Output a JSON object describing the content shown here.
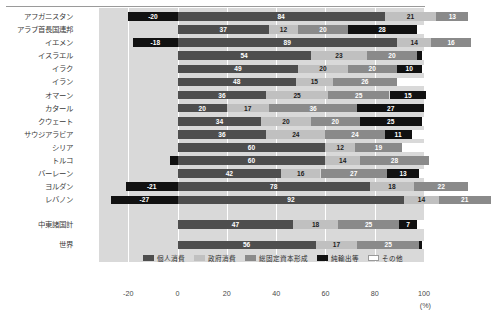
{
  "chart_data": {
    "type": "bar",
    "orientation": "horizontal",
    "stacked": true,
    "title": "",
    "xlabel": "(%)",
    "ylabel": "",
    "xlim": [
      -40,
      100
    ],
    "xticks": [
      -20,
      0,
      20,
      40,
      60,
      80,
      100
    ],
    "xtick_labels": [
      "-20",
      "0",
      "20",
      "40",
      "60",
      "80",
      "100"
    ],
    "grid": true,
    "legend_position": "bottom",
    "categories": [
      "アフガニスタン",
      "アラブ首長国連邦",
      "イエメン",
      "イスラエル",
      "イラク",
      "イラン",
      "オマーン",
      "カタール",
      "クウェート",
      "サウジアラビア",
      "シリア",
      "トルコ",
      "バーレーン",
      "ヨルダン",
      "レバノン",
      "中東諸国計",
      "世界"
    ],
    "series": [
      {
        "name": "個人消費",
        "color": "#4e4e4e",
        "values": [
          84,
          37,
          89,
          54,
          49,
          48,
          36,
          20,
          34,
          36,
          60,
          60,
          42,
          78,
          92,
          47,
          56
        ]
      },
      {
        "name": "政府消費",
        "color": "#c0c0c0",
        "values": [
          21,
          12,
          14,
          23,
          20,
          15,
          25,
          17,
          20,
          24,
          12,
          14,
          16,
          18,
          14,
          18,
          17
        ]
      },
      {
        "name": "総固定資本形成",
        "color": "#8a8a8a",
        "values": [
          13,
          20,
          16,
          20,
          20,
          26,
          25,
          36,
          20,
          24,
          19,
          28,
          27,
          22,
          21,
          25,
          25
        ]
      },
      {
        "name": "純輸出等",
        "color": "#111111",
        "values": [
          -20,
          28,
          -18,
          2,
          10,
          0,
          15,
          27,
          25,
          11,
          0,
          -3,
          13,
          0,
          -27,
          7,
          1
        ]
      },
      {
        "name": "その他",
        "color": "#ffffff",
        "values": [
          2,
          3,
          0,
          1,
          1,
          11,
          0,
          0,
          1,
          5,
          9,
          1,
          2,
          5,
          0,
          3,
          1
        ]
      }
    ],
    "rows": [
      {
        "label": "アフガニスタン",
        "net": -20,
        "net_label": "-20",
        "personal": 84,
        "gov": 21,
        "capital": 13,
        "other": 4
      },
      {
        "label": "アラブ首長国連邦",
        "net": 28,
        "net_label": "28",
        "personal": 37,
        "gov": 12,
        "capital": 20,
        "other": 3
      },
      {
        "label": "イエメン",
        "net": -18,
        "net_label": "-18",
        "personal": 89,
        "gov": 14,
        "capital": 16,
        "other": 0
      },
      {
        "label": "イスラエル",
        "net": 2,
        "net_label": "2",
        "personal": 54,
        "gov": 23,
        "capital": 20,
        "other": 1
      },
      {
        "label": "イラク",
        "net": 10,
        "net_label": "10",
        "personal": 49,
        "gov": 20,
        "capital": 20,
        "other": 1
      },
      {
        "label": "イラン",
        "net": 0,
        "net_label": "0",
        "personal": 48,
        "gov": 15,
        "capital": 26,
        "other": 11
      },
      {
        "label": "オマーン",
        "net": 15,
        "net_label": "15",
        "personal": 36,
        "gov": 25,
        "capital": 25,
        "other": 0
      },
      {
        "label": "カタール",
        "net": 27,
        "net_label": "27",
        "personal": 20,
        "gov": 17,
        "capital": 36,
        "other": 0
      },
      {
        "label": "クウェート",
        "net": 25,
        "net_label": "25",
        "personal": 34,
        "gov": 20,
        "capital": 20,
        "other": 1
      },
      {
        "label": "サウジアラビア",
        "net": 11,
        "net_label": "11",
        "personal": 36,
        "gov": 24,
        "capital": 24,
        "other": 5
      },
      {
        "label": "シリア",
        "net": 0,
        "net_label": "0",
        "personal": 60,
        "gov": 12,
        "capital": 19,
        "other": 9
      },
      {
        "label": "トルコ",
        "net": -3,
        "net_label": "-3",
        "personal": 60,
        "gov": 14,
        "capital": 28,
        "other": 1
      },
      {
        "label": "バーレーン",
        "net": 13,
        "net_label": "13",
        "personal": 42,
        "gov": 16,
        "capital": 27,
        "other": 2
      },
      {
        "label": "ヨルダン",
        "net": -21,
        "net_label": "-21",
        "personal": 78,
        "gov": 18,
        "capital": 22,
        "other": 5
      },
      {
        "label": "レバノン",
        "net": -27,
        "net_label": "-27",
        "personal": 92,
        "gov": 14,
        "capital": 21,
        "other": 0
      },
      {
        "label": "中東諸国計",
        "net": 7,
        "net_label": "7",
        "personal": 47,
        "gov": 18,
        "capital": 25,
        "other": 3
      },
      {
        "label": "世界",
        "net": 1,
        "net_label": "1",
        "personal": 56,
        "gov": 17,
        "capital": 25,
        "other": 1
      }
    ],
    "legend": [
      {
        "label": "個人消費",
        "color": "#4e4e4e"
      },
      {
        "label": "政府消費",
        "color": "#c0c0c0"
      },
      {
        "label": "総固定資本形成",
        "color": "#8a8a8a"
      },
      {
        "label": "純輸出等",
        "color": "#111111"
      },
      {
        "label": "その他",
        "color": "#ffffff"
      }
    ]
  }
}
